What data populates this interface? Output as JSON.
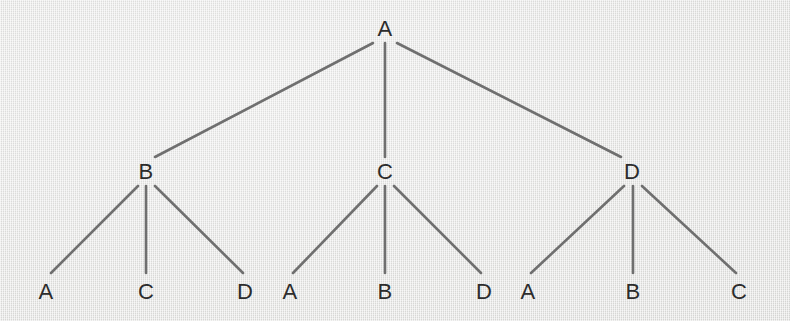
{
  "diagram": {
    "type": "tree",
    "background_color": "#e5e5e3",
    "line_color": "#6f6f6f",
    "text_color": "#2c2c2c",
    "canvas": {
      "width": 790,
      "height": 321
    },
    "levels": [
      {
        "level": 0,
        "nodes": [
          {
            "id": "root",
            "label": "A",
            "x": 385,
            "y": 29
          }
        ]
      },
      {
        "level": 1,
        "nodes": [
          {
            "id": "n-b",
            "label": "B",
            "x": 146,
            "y": 172
          },
          {
            "id": "n-c",
            "label": "C",
            "x": 385,
            "y": 172
          },
          {
            "id": "n-d",
            "label": "D",
            "x": 632,
            "y": 172
          }
        ]
      },
      {
        "level": 2,
        "nodes": [
          {
            "id": "l-b-a",
            "label": "A",
            "x": 46,
            "y": 292
          },
          {
            "id": "l-b-c",
            "label": "C",
            "x": 146,
            "y": 292
          },
          {
            "id": "l-b-d",
            "label": "D",
            "x": 245,
            "y": 292
          },
          {
            "id": "l-c-a",
            "label": "A",
            "x": 290,
            "y": 292
          },
          {
            "id": "l-c-b",
            "label": "B",
            "x": 385,
            "y": 292
          },
          {
            "id": "l-c-d",
            "label": "D",
            "x": 484,
            "y": 292
          },
          {
            "id": "l-d-a",
            "label": "A",
            "x": 528,
            "y": 292
          },
          {
            "id": "l-d-b",
            "label": "B",
            "x": 633,
            "y": 292
          },
          {
            "id": "l-d-c",
            "label": "C",
            "x": 739,
            "y": 292
          }
        ]
      }
    ],
    "edges": [
      {
        "id": "e-root-b",
        "from": "root",
        "to": "n-b",
        "x1": 373,
        "y1": 43,
        "x2": 155,
        "y2": 157
      },
      {
        "id": "e-root-c",
        "from": "root",
        "to": "n-c",
        "x1": 385,
        "y1": 43,
        "x2": 385,
        "y2": 157
      },
      {
        "id": "e-root-d",
        "from": "root",
        "to": "n-d",
        "x1": 397,
        "y1": 43,
        "x2": 621,
        "y2": 157
      },
      {
        "id": "e-b-a",
        "from": "n-b",
        "to": "l-b-a",
        "x1": 138,
        "y1": 186,
        "x2": 51,
        "y2": 273
      },
      {
        "id": "e-b-c",
        "from": "n-b",
        "to": "l-b-c",
        "x1": 146,
        "y1": 186,
        "x2": 146,
        "y2": 273
      },
      {
        "id": "e-b-d",
        "from": "n-b",
        "to": "l-b-d",
        "x1": 155,
        "y1": 186,
        "x2": 243,
        "y2": 273
      },
      {
        "id": "e-c-a",
        "from": "n-c",
        "to": "l-c-a",
        "x1": 377,
        "y1": 186,
        "x2": 293,
        "y2": 273
      },
      {
        "id": "e-c-b",
        "from": "n-c",
        "to": "l-c-b",
        "x1": 385,
        "y1": 186,
        "x2": 385,
        "y2": 273
      },
      {
        "id": "e-c-d",
        "from": "n-c",
        "to": "l-c-d",
        "x1": 394,
        "y1": 186,
        "x2": 481,
        "y2": 273
      },
      {
        "id": "e-d-a",
        "from": "n-d",
        "to": "l-d-a",
        "x1": 624,
        "y1": 186,
        "x2": 531,
        "y2": 273
      },
      {
        "id": "e-d-b",
        "from": "n-d",
        "to": "l-d-b",
        "x1": 633,
        "y1": 186,
        "x2": 633,
        "y2": 273
      },
      {
        "id": "e-d-c",
        "from": "n-d",
        "to": "l-d-c",
        "x1": 642,
        "y1": 186,
        "x2": 736,
        "y2": 273
      }
    ]
  }
}
